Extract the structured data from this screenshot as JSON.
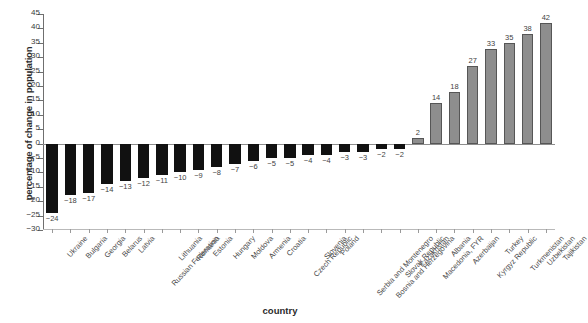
{
  "chart_data": {
    "type": "bar",
    "title": "",
    "subtitle": "",
    "xlabel": "country",
    "ylabel": "percentage of change in population",
    "ylim": [
      -30,
      45
    ],
    "ytick_step": 5,
    "yticks": [
      45,
      40,
      35,
      30,
      25,
      20,
      15,
      10,
      5,
      0,
      -5,
      -10,
      -15,
      -20,
      -25,
      -30
    ],
    "ytick_labels": [
      "45",
      "40",
      "35",
      "30",
      "25",
      "20",
      "15",
      "10",
      "5",
      "0",
      "−5",
      "−10",
      "−15",
      "−20",
      "−25",
      "−30"
    ],
    "grid": false,
    "legend": null,
    "categories": [
      "Ukraine",
      "Bulgaria",
      "Georgia",
      "Belarus",
      "Latvia",
      "Russian Federation",
      "Lithuania",
      "Romania",
      "Estonia",
      "Hungary",
      "Moldova",
      "Armenia",
      "Croatia",
      "Czech Republic",
      "Slovenia",
      "Poland",
      "Serbia and Montenegro",
      "Bosnia and Herzegovina",
      "Slovak Republic",
      "Kazakhstan",
      "Macedonia, FYR",
      "Albania",
      "Azerbaijan",
      "Kyrgyz Republic",
      "Turkey",
      "Turkmenistan",
      "Uzbekistan",
      "Tajikistan"
    ],
    "values": [
      -24,
      -18,
      -17,
      -14,
      -13,
      -12,
      -11,
      -10,
      -9,
      -8,
      -7,
      -6,
      -5,
      -5,
      -4,
      -4,
      -3,
      -3,
      -2,
      -2,
      2,
      14,
      18,
      27,
      33,
      35,
      38,
      42
    ],
    "value_labels": [
      "−24",
      "−18",
      "−17",
      "−14",
      "−13",
      "−12",
      "−11",
      "−10",
      "−9",
      "−8",
      "−7",
      "−6",
      "−5",
      "−5",
      "−4",
      "−4",
      "−3",
      "−3",
      "−2",
      "−2",
      "2",
      "14",
      "18",
      "27",
      "33",
      "35",
      "38",
      "42"
    ],
    "colors": {
      "negative_bar": "#111111",
      "positive_bar": "#8e8e8e",
      "positive_bar_border": "#565656",
      "axis": "#6f6f6f",
      "text": "#3f3f3f",
      "background": "#ffffff"
    }
  }
}
